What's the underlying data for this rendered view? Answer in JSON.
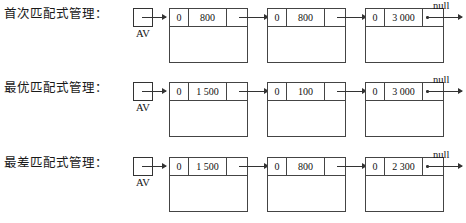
{
  "figure": {
    "title": "",
    "null_label": "null",
    "head_label": "AV"
  },
  "rows": [
    {
      "caption": "首次匹配式管理：",
      "head_label": "AV",
      "null_label": "null",
      "nodes": [
        {
          "tag": "0",
          "size": "800"
        },
        {
          "tag": "0",
          "size": "800"
        },
        {
          "tag": "0",
          "size": "3 000"
        }
      ]
    },
    {
      "caption": "最优匹配式管理：",
      "head_label": "AV",
      "null_label": "null",
      "nodes": [
        {
          "tag": "0",
          "size": "1 500"
        },
        {
          "tag": "0",
          "size": "100"
        },
        {
          "tag": "0",
          "size": "3 000"
        }
      ]
    },
    {
      "caption": "最差匹配式管理：",
      "head_label": "AV",
      "null_label": "null",
      "nodes": [
        {
          "tag": "0",
          "size": "1 500"
        },
        {
          "tag": "0",
          "size": "800"
        },
        {
          "tag": "0",
          "size": "2 300"
        }
      ]
    }
  ]
}
